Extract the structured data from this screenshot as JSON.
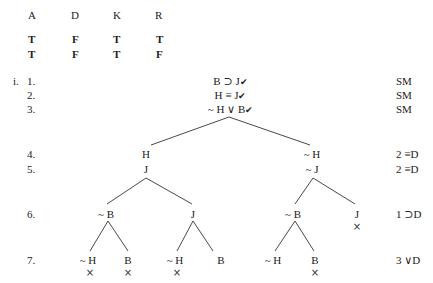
{
  "truth_table": {
    "headers": [
      "A",
      "D",
      "K",
      "R"
    ],
    "rows": [
      [
        "T",
        "F",
        "T",
        "T"
      ],
      [
        "T",
        "F",
        "T",
        "F"
      ]
    ]
  },
  "tree": {
    "problem_label": "i.",
    "line_numbers": [
      "1.",
      "2.",
      "3.",
      "4.",
      "5.",
      "6.",
      "7."
    ],
    "premises": [
      {
        "text": "B ⊃ J",
        "checked": true,
        "justification": "SM"
      },
      {
        "text": "H ≡ J",
        "checked": true,
        "justification": "SM"
      },
      {
        "text": "~ H ∨ B",
        "checked": true,
        "justification": "SM"
      }
    ],
    "check_mark": "✔",
    "closed_mark": "×",
    "justifications": {
      "line4": "2 ≡D",
      "line5": "2 ≡D",
      "line6": "1 ⊃D",
      "line7": "3 ∨D"
    },
    "nodes": {
      "l4_left": "H",
      "l4_right": "~ H",
      "l5_left": "J",
      "l5_right": "~ J",
      "l6_a": "~ B",
      "l6_b": "J",
      "l6_c": "~ B",
      "l6_d": "J",
      "l7_a": "~ H",
      "l7_b": "B",
      "l7_c": "~ H",
      "l7_d": "B",
      "l7_e": "~ H",
      "l7_f": "B"
    }
  }
}
